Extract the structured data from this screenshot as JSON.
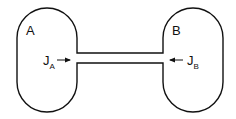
{
  "diagram": {
    "compartments": [
      {
        "id": "A",
        "label": "A",
        "flux_label": "J",
        "flux_sub": "A",
        "flux_direction": "right"
      },
      {
        "id": "B",
        "label": "B",
        "flux_label": "J",
        "flux_sub": "B",
        "flux_direction": "left"
      }
    ],
    "connector": "tube"
  }
}
